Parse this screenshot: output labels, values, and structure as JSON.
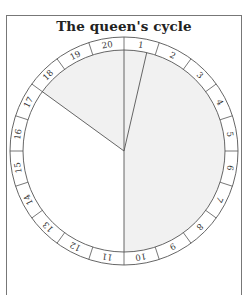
{
  "title": "The queen's cycle",
  "diagram": {
    "type": "circular-cycle",
    "segments": [
      "1",
      "2",
      "3",
      "4",
      "5",
      "6",
      "7",
      "8",
      "9",
      "10",
      "11",
      "12",
      "13",
      "14",
      "15",
      "16",
      "17",
      "18",
      "19",
      "20"
    ],
    "shaded_ranges_degrees": [
      [
        0,
        180
      ],
      [
        306,
        360
      ]
    ],
    "radial_lines_degrees": [
      0,
      13,
      180,
      306
    ],
    "colors": {
      "shade": "#f1f1f1",
      "line": "#555555",
      "text": "#333333"
    }
  }
}
